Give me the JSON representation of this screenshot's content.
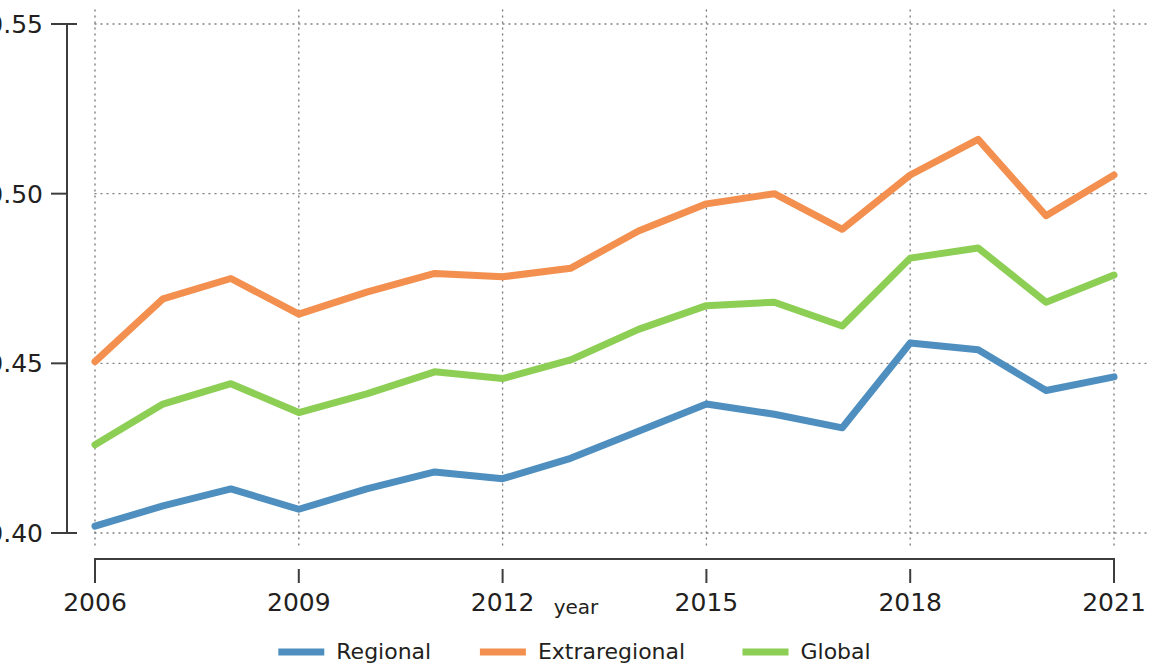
{
  "chart_data": {
    "type": "line",
    "title": "",
    "xlabel": "year",
    "ylabel": "",
    "x": [
      2006,
      2007,
      2008,
      2009,
      2010,
      2011,
      2012,
      2013,
      2014,
      2015,
      2016,
      2017,
      2018,
      2019,
      2020,
      2021
    ],
    "xlim": [
      2006,
      2021
    ],
    "ylim": [
      0.4,
      0.55
    ],
    "xticks": [
      "2006",
      "2009",
      "2012",
      "2015",
      "2018",
      "2021"
    ],
    "xtick_values": [
      2006,
      2009,
      2012,
      2015,
      2018,
      2021
    ],
    "yticks": [
      "0.40",
      "0.45",
      "0.50",
      "0.55"
    ],
    "ytick_values": [
      0.4,
      0.45,
      0.5,
      0.55
    ],
    "grid": "dotted-both-axes",
    "legend_position": "bottom-center",
    "series": [
      {
        "name": "Regional",
        "color": "#4e8fc0",
        "values": [
          0.402,
          0.408,
          0.413,
          0.407,
          0.413,
          0.418,
          0.416,
          0.422,
          0.43,
          0.438,
          0.435,
          0.431,
          0.456,
          0.454,
          0.442,
          0.446
        ]
      },
      {
        "name": "Extraregional",
        "color": "#f3904f",
        "values": [
          0.4505,
          0.469,
          0.475,
          0.4645,
          0.471,
          0.4765,
          0.4755,
          0.478,
          0.489,
          0.497,
          0.5,
          0.4895,
          0.5055,
          0.516,
          0.4935,
          0.5055
        ]
      },
      {
        "name": "Global",
        "color": "#8dce54",
        "values": [
          0.426,
          0.438,
          0.444,
          0.4355,
          0.441,
          0.4475,
          0.4455,
          0.451,
          0.46,
          0.467,
          0.468,
          0.461,
          0.481,
          0.484,
          0.468,
          0.476
        ]
      }
    ]
  },
  "legend": {
    "items": [
      {
        "label": "Regional",
        "color": "#4e8fc0"
      },
      {
        "label": "Extraregional",
        "color": "#f3904f"
      },
      {
        "label": "Global",
        "color": "#8dce54"
      }
    ]
  },
  "axes": {
    "x_title": "year"
  }
}
